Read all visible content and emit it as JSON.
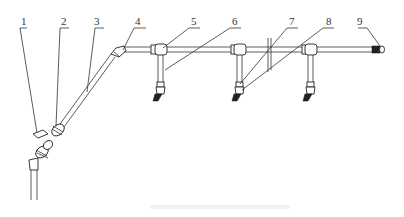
{
  "figure": {
    "type": "pipe-assembly-diagram",
    "callouts": [
      {
        "id": "1",
        "label": "1"
      },
      {
        "id": "2",
        "label": "2"
      },
      {
        "id": "3",
        "label": "3"
      },
      {
        "id": "4",
        "label": "4"
      },
      {
        "id": "5",
        "label": "5"
      },
      {
        "id": "6",
        "label": "6"
      },
      {
        "id": "7",
        "label": "7"
      },
      {
        "id": "8",
        "label": "8"
      },
      {
        "id": "9",
        "label": "9"
      }
    ],
    "caption": ""
  }
}
